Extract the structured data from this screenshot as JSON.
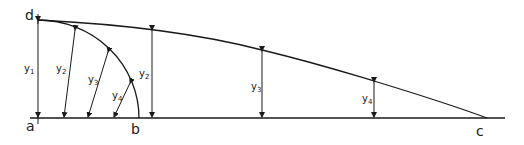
{
  "diagram": {
    "type": "geometric-construction",
    "stroke_color": "#1a1a1a",
    "background": "#ffffff",
    "points": {
      "a": {
        "label": "a",
        "x": 38,
        "y": 118
      },
      "b": {
        "label": "b",
        "x": 139,
        "y": 118
      },
      "c": {
        "label": "c",
        "x": 487,
        "y": 118
      },
      "d": {
        "label": "d",
        "x": 38,
        "y": 20
      }
    },
    "baseline": {
      "x1": 30,
      "x2": 505,
      "y": 118
    },
    "arc_db": {
      "from": "d",
      "to": "b",
      "center": "a"
    },
    "curve_dc": {
      "from": "d",
      "to": "c",
      "through": [
        [
          152,
          29
        ],
        [
          262,
          50
        ],
        [
          374,
          81
        ]
      ]
    },
    "vertical_ordinates": [
      {
        "label": "y",
        "sub": "1",
        "x": 38,
        "y_top": 20,
        "label_x": 26,
        "label_y": 72
      },
      {
        "label": "y",
        "sub": "2",
        "x": 152,
        "y_top": 29,
        "label_x": 139,
        "label_y": 77
      },
      {
        "label": "y",
        "sub": "3",
        "x": 262,
        "y_top": 50,
        "label_x": 251,
        "label_y": 90
      },
      {
        "label": "y",
        "sub": "4",
        "x": 374,
        "y_top": 81,
        "label_x": 362,
        "label_y": 102
      }
    ],
    "radial_ordinates": [
      {
        "label": "y",
        "sub": "2",
        "x1": 75,
        "y1": 29,
        "x2": 64,
        "y2": 118,
        "label_x": 56,
        "label_y": 72
      },
      {
        "label": "y",
        "sub": "3",
        "x1": 108,
        "y1": 51,
        "x2": 88,
        "y2": 118,
        "label_x": 88,
        "label_y": 83
      },
      {
        "label": "y",
        "sub": "4",
        "x1": 130,
        "y1": 82,
        "x2": 114,
        "y2": 118,
        "label_x": 112,
        "label_y": 99
      }
    ]
  }
}
